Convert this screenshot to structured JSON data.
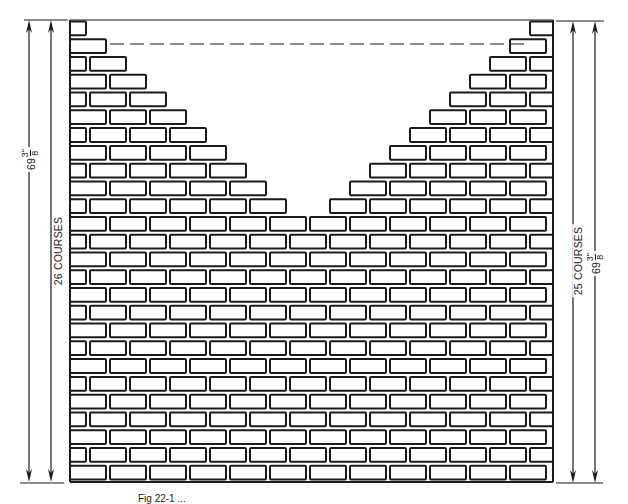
{
  "figure": {
    "caption_visible": "Fig 22-1 ...",
    "left_dimensions": {
      "courses_label": "26 COURSES",
      "height_whole": "69",
      "height_fraction_num": "3\"",
      "height_fraction_den": "8"
    },
    "right_dimensions": {
      "courses_label": "25 COURSES",
      "height_whole": "69",
      "height_fraction_num": "3\"",
      "height_fraction_den": "8"
    }
  },
  "wall": {
    "left_x": 70,
    "right_x": 553,
    "top_y": 20,
    "bottom_y": 482,
    "rows": 26,
    "brick_width": 36,
    "half_brick_width": 16,
    "joint": 4,
    "line_color": "#1a1a1a",
    "dashed_line_y": 44,
    "left_extent": [
      86,
      110,
      131,
      151,
      172,
      191,
      212,
      231,
      252,
      272,
      293,
      332,
      553,
      553,
      553,
      553,
      553,
      553,
      553,
      553,
      553,
      553,
      553,
      553,
      553,
      553
    ],
    "right_extent": [
      524,
      503,
      481,
      461,
      440,
      422,
      401,
      382,
      362,
      342,
      313,
      300,
      70,
      70,
      70,
      70,
      70,
      70,
      70,
      70,
      70,
      70,
      70,
      70,
      70,
      70
    ]
  },
  "colors": {
    "ink": "#1a1a1a",
    "paper": "#ffffff"
  }
}
